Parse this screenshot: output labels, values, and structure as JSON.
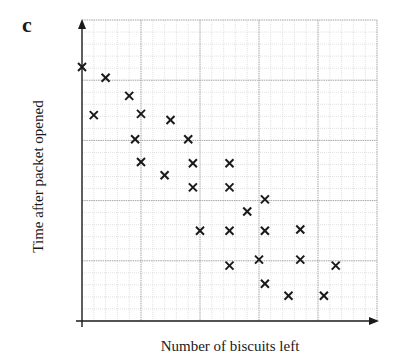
{
  "panel": {
    "label": "c"
  },
  "chart_data": {
    "type": "scatter",
    "title": "",
    "xlabel": "Number of biscuits left",
    "ylabel": "Time after packet opened",
    "xlim": [
      0,
      25
    ],
    "ylim": [
      0,
      25
    ],
    "grid": true,
    "grid_major_step": 5,
    "grid_minor_step": 1,
    "axis_ticks_labeled": false,
    "legend": null,
    "marker": "x",
    "points": [
      {
        "x": 0,
        "y": 21.1
      },
      {
        "x": 2,
        "y": 20.2
      },
      {
        "x": 4,
        "y": 18.7
      },
      {
        "x": 1,
        "y": 17.1
      },
      {
        "x": 5,
        "y": 17.2
      },
      {
        "x": 7.5,
        "y": 16.7
      },
      {
        "x": 4.5,
        "y": 15.1
      },
      {
        "x": 9,
        "y": 15.1
      },
      {
        "x": 5,
        "y": 13.2
      },
      {
        "x": 9.4,
        "y": 13.1
      },
      {
        "x": 7,
        "y": 12.1
      },
      {
        "x": 12.5,
        "y": 13.1
      },
      {
        "x": 9.4,
        "y": 11.1
      },
      {
        "x": 12.5,
        "y": 11.1
      },
      {
        "x": 15.5,
        "y": 10.1
      },
      {
        "x": 14,
        "y": 9.1
      },
      {
        "x": 10,
        "y": 7.5
      },
      {
        "x": 12.5,
        "y": 7.5
      },
      {
        "x": 15.5,
        "y": 7.5
      },
      {
        "x": 18.5,
        "y": 7.6
      },
      {
        "x": 12.5,
        "y": 4.6
      },
      {
        "x": 15,
        "y": 5.1
      },
      {
        "x": 18.5,
        "y": 5.1
      },
      {
        "x": 21.5,
        "y": 4.6
      },
      {
        "x": 15.5,
        "y": 3.1
      },
      {
        "x": 17.5,
        "y": 2.1
      },
      {
        "x": 20.5,
        "y": 2.1
      }
    ]
  },
  "colors": {
    "axis": "#1a1a1a",
    "marker": "#1a1a1a",
    "grid_major": "#9a9a9a",
    "grid_minor": "#d4d4d4",
    "background": "#ffffff"
  }
}
